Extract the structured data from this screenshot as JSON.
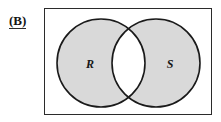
{
  "figure": {
    "panel_label": "(B)",
    "shaded_region": "symmetric difference",
    "background_color": "#ffffff",
    "border_color": "#2b2b2b",
    "shade_color": "#d9d9d9",
    "circle_outline_color": "#1a1a1a",
    "universe": {
      "name": "universal-set-rectangle",
      "x": 44,
      "y": 8,
      "width": 168,
      "height": 107
    },
    "sets": [
      {
        "id": "R",
        "label": "R",
        "center_x": 57,
        "center_y": 55,
        "radius": 44,
        "label_x": 46,
        "label_y": 60,
        "shaded": true
      },
      {
        "id": "S",
        "label": "S",
        "center_x": 112,
        "center_y": 55,
        "radius": 44,
        "label_x": 126,
        "label_y": 60,
        "shaded": true
      }
    ],
    "intersection": {
      "id": "R-and-S",
      "shaded": false,
      "fill": "#ffffff"
    }
  }
}
